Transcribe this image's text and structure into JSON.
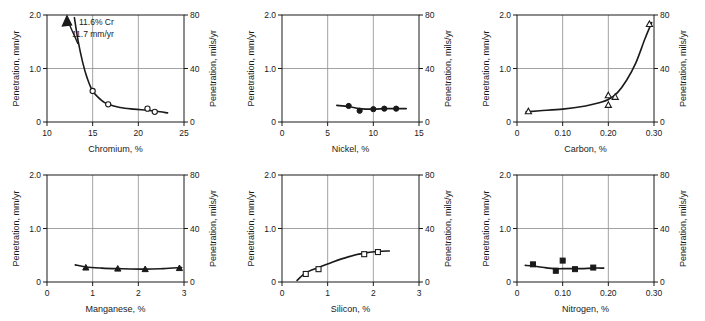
{
  "figure": {
    "panel_count": 6,
    "left_axis_title": "Penetration, mm/yr",
    "right_axis_title": "Penetration, mils/yr",
    "left_ticks": [
      "0",
      "1.0",
      "2.0"
    ],
    "right_ticks": [
      "0",
      "40",
      "80"
    ]
  },
  "chart_data": [
    {
      "type": "scatter",
      "id": "chromium",
      "title": "",
      "xlabel": "Chromium, %",
      "ylabel": "Penetration, mm/yr",
      "y2label": "Penetration, mils/yr",
      "xlim": [
        10,
        25
      ],
      "ylim": [
        0,
        2.0
      ],
      "y2lim": [
        0,
        80
      ],
      "xticks": [
        10,
        15,
        20,
        25
      ],
      "xticklabels": [
        "10",
        "15",
        "20",
        "25"
      ],
      "yticks": [
        0,
        1.0,
        2.0
      ],
      "yticklabels": [
        "0",
        "1.0",
        "2.0"
      ],
      "y2ticks": [
        0,
        40,
        80
      ],
      "y2ticklabels": [
        "0",
        "40",
        "80"
      ],
      "grid": true,
      "marker": "open-circle",
      "x": [
        15.0,
        16.7,
        21.0,
        21.8
      ],
      "y": [
        0.58,
        0.33,
        0.25,
        0.19
      ],
      "curve_x": [
        13.0,
        13.4,
        13.9,
        14.4,
        15.0,
        16.0,
        16.7,
        18.0,
        19.5,
        21.0,
        22.0,
        23.2
      ],
      "curve_y": [
        1.95,
        1.52,
        1.12,
        0.82,
        0.58,
        0.4,
        0.33,
        0.27,
        0.24,
        0.22,
        0.2,
        0.17
      ],
      "annotations": [
        {
          "text_line1": "11.6% Cr",
          "text_line2": "11.7 mm/yr",
          "arrow": true
        }
      ]
    },
    {
      "type": "scatter",
      "id": "nickel",
      "xlabel": "Nickel, %",
      "ylabel": "Penetration, mm/yr",
      "y2label": "Penetration, mils/yr",
      "xlim": [
        0,
        15
      ],
      "ylim": [
        0,
        2.0
      ],
      "y2lim": [
        0,
        80
      ],
      "xticks": [
        0,
        5,
        10,
        15
      ],
      "xticklabels": [
        "0",
        "5",
        "10",
        "15"
      ],
      "yticks": [
        0,
        1.0,
        2.0
      ],
      "yticklabels": [
        "0",
        "1.0",
        "2.0"
      ],
      "y2ticks": [
        0,
        40,
        80
      ],
      "y2ticklabels": [
        "0",
        "40",
        "80"
      ],
      "grid": true,
      "marker": "filled-circle",
      "x": [
        7.3,
        8.5,
        10.0,
        11.2,
        12.5
      ],
      "y": [
        0.3,
        0.21,
        0.24,
        0.25,
        0.25
      ],
      "curve_x": [
        6.0,
        7.3,
        8.5,
        10.0,
        11.2,
        12.5,
        13.6
      ],
      "curve_y": [
        0.31,
        0.29,
        0.25,
        0.24,
        0.25,
        0.25,
        0.25
      ]
    },
    {
      "type": "scatter",
      "id": "carbon",
      "xlabel": "Carbon, %",
      "ylabel": "Penetration, mm/yr",
      "y2label": "Penetration, mils/yr",
      "xlim": [
        0,
        0.3
      ],
      "ylim": [
        0,
        2.0
      ],
      "y2lim": [
        0,
        80
      ],
      "xticks": [
        0,
        0.1,
        0.2,
        0.3
      ],
      "xticklabels": [
        "0",
        "0.10",
        "0.20",
        "0.30"
      ],
      "yticks": [
        0,
        1.0,
        2.0
      ],
      "yticklabels": [
        "0",
        "1.0",
        "2.0"
      ],
      "y2ticks": [
        0,
        40,
        80
      ],
      "y2ticklabels": [
        "0",
        "40",
        "80"
      ],
      "grid": true,
      "marker": "open-triangle",
      "x": [
        0.025,
        0.2,
        0.2,
        0.215,
        0.29
      ],
      "y": [
        0.2,
        0.5,
        0.32,
        0.47,
        1.83
      ],
      "curve_x": [
        0.02,
        0.05,
        0.1,
        0.15,
        0.18,
        0.2,
        0.22,
        0.24,
        0.26,
        0.28,
        0.295
      ],
      "curve_y": [
        0.19,
        0.21,
        0.24,
        0.3,
        0.36,
        0.42,
        0.55,
        0.78,
        1.1,
        1.55,
        1.86
      ]
    },
    {
      "type": "scatter",
      "id": "manganese",
      "xlabel": "Manganese, %",
      "ylabel": "Penetration, mm/yr",
      "y2label": "Penetration, mils/yr",
      "xlim": [
        0,
        3
      ],
      "ylim": [
        0,
        2.0
      ],
      "y2lim": [
        0,
        80
      ],
      "xticks": [
        0,
        1,
        2,
        3
      ],
      "xticklabels": [
        "0",
        "1",
        "2",
        "3"
      ],
      "yticks": [
        0,
        1.0,
        2.0
      ],
      "yticklabels": [
        "0",
        "1.0",
        "2.0"
      ],
      "y2ticks": [
        0,
        40,
        80
      ],
      "y2ticklabels": [
        "0",
        "40",
        "80"
      ],
      "grid": true,
      "marker": "filled-triangle",
      "x": [
        0.85,
        1.55,
        2.15,
        2.9
      ],
      "y": [
        0.27,
        0.25,
        0.24,
        0.26
      ],
      "curve_x": [
        0.62,
        0.85,
        1.2,
        1.55,
        2.15,
        2.55,
        2.95
      ],
      "curve_y": [
        0.32,
        0.28,
        0.26,
        0.25,
        0.24,
        0.25,
        0.27
      ]
    },
    {
      "type": "scatter",
      "id": "silicon",
      "xlabel": "Silicon, %",
      "ylabel": "Penetration, mm/yr",
      "y2label": "Penetration, mils/yr",
      "xlim": [
        0,
        3
      ],
      "ylim": [
        0,
        2.0
      ],
      "y2lim": [
        0,
        80
      ],
      "xticks": [
        0,
        1,
        2,
        3
      ],
      "xticklabels": [
        "0",
        "1",
        "2",
        "3"
      ],
      "yticks": [
        0,
        1.0,
        2.0
      ],
      "yticklabels": [
        "0",
        "1.0",
        "2.0"
      ],
      "y2ticks": [
        0,
        40,
        80
      ],
      "y2ticklabels": [
        "0",
        "40",
        "80"
      ],
      "grid": true,
      "marker": "open-square",
      "x": [
        0.52,
        0.8,
        1.8,
        2.1
      ],
      "y": [
        0.15,
        0.24,
        0.52,
        0.56
      ],
      "curve_x": [
        0.33,
        0.52,
        0.8,
        1.1,
        1.45,
        1.8,
        2.1,
        2.35
      ],
      "curve_y": [
        0.03,
        0.17,
        0.27,
        0.37,
        0.47,
        0.54,
        0.57,
        0.58
      ]
    },
    {
      "type": "scatter",
      "id": "nitrogen",
      "xlabel": "Nitrogen, %",
      "ylabel": "Penetration, mm/yr",
      "y2label": "Penetration, mils/yr",
      "xlim": [
        0,
        0.3
      ],
      "ylim": [
        0,
        2.0
      ],
      "y2lim": [
        0,
        80
      ],
      "xticks": [
        0,
        0.1,
        0.2,
        0.3
      ],
      "xticklabels": [
        "0",
        "0.10",
        "0.20",
        "0.30"
      ],
      "yticks": [
        0,
        1.0,
        2.0
      ],
      "yticklabels": [
        "0",
        "1.0",
        "2.0"
      ],
      "y2ticks": [
        0,
        40,
        80
      ],
      "y2ticklabels": [
        "0",
        "40",
        "80"
      ],
      "grid": true,
      "marker": "filled-square",
      "x": [
        0.035,
        0.085,
        0.1,
        0.127,
        0.167
      ],
      "y": [
        0.33,
        0.21,
        0.4,
        0.24,
        0.27
      ],
      "curve_x": [
        0.018,
        0.035,
        0.06,
        0.085,
        0.11,
        0.14,
        0.167,
        0.19
      ],
      "curve_y": [
        0.31,
        0.3,
        0.27,
        0.25,
        0.25,
        0.25,
        0.26,
        0.26
      ]
    }
  ]
}
